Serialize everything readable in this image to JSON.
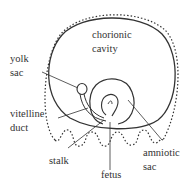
{
  "labels": {
    "chorionic_1": "chorionic",
    "chorionic_2": "cavity",
    "yolk_1": "yolk",
    "yolk_2": "sac",
    "vitelline_1": "vitelline",
    "vitelline_2": "duct",
    "stalk": "stalk",
    "fetus": "fetus",
    "amniotic_1": "amniotic",
    "amniotic_2": "sac"
  },
  "colors": {
    "line": "#333333",
    "background": "#ffffff"
  }
}
